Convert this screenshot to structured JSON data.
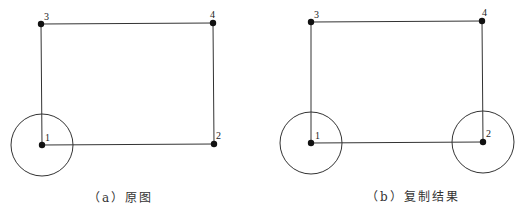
{
  "diagram": {
    "colors": {
      "stroke": "#333333",
      "node": "#111111",
      "background": "#ffffff"
    },
    "panels": [
      {
        "id": "a",
        "caption": "（a）原图",
        "nodes": [
          {
            "label": "1",
            "x": 42,
            "y": 145
          },
          {
            "label": "2",
            "x": 214,
            "y": 144
          },
          {
            "label": "3",
            "x": 41,
            "y": 24
          },
          {
            "label": "4",
            "x": 213,
            "y": 23
          }
        ],
        "edges": [
          [
            "1",
            "2"
          ],
          [
            "1",
            "3"
          ],
          [
            "3",
            "4"
          ],
          [
            "4",
            "2"
          ]
        ],
        "circles": [
          {
            "center_node": "1",
            "radius": 31
          }
        ]
      },
      {
        "id": "b",
        "caption": "（b）复制结果",
        "nodes": [
          {
            "label": "1",
            "x": 51,
            "y": 143
          },
          {
            "label": "2",
            "x": 223,
            "y": 142
          },
          {
            "label": "3",
            "x": 51,
            "y": 22
          },
          {
            "label": "4",
            "x": 222,
            "y": 21
          }
        ],
        "edges": [
          [
            "1",
            "2"
          ],
          [
            "1",
            "3"
          ],
          [
            "3",
            "4"
          ],
          [
            "4",
            "2"
          ]
        ],
        "circles": [
          {
            "center_node": "1",
            "radius": 31
          },
          {
            "center_node": "2",
            "radius": 31
          }
        ]
      }
    ]
  }
}
